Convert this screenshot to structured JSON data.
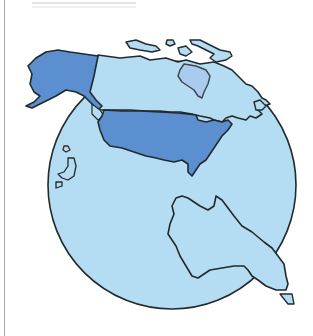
{
  "illustration": {
    "subject": "Globe showing North America and Australia",
    "regions": [
      {
        "name": "Alaska",
        "fill": "#5b8fd0",
        "highlighted": true
      },
      {
        "name": "United States (contiguous)",
        "fill": "#5b8fd0",
        "highlighted": true
      },
      {
        "name": "Canada",
        "fill": "#b4dcf3",
        "highlighted": false
      },
      {
        "name": "Hudson Bay",
        "fill": "#a9cbee",
        "highlighted": false
      },
      {
        "name": "Australia",
        "fill": "#b4dcf3",
        "highlighted": false
      },
      {
        "name": "Tasmania",
        "fill": "#b4dcf3",
        "highlighted": false
      },
      {
        "name": "Pacific islands",
        "fill": "#b4dcf3",
        "highlighted": false
      }
    ],
    "colors": {
      "ocean": "#b4dcf3",
      "highlight": "#5b8fd0",
      "outline": "#222a2c",
      "background": "#ffffff",
      "frame": "#a9a9a9"
    }
  }
}
